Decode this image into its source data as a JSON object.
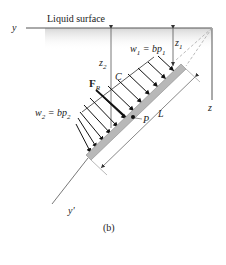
{
  "figure": {
    "caption": "(b)",
    "labels": {
      "liquid_surface": "Liquid surface",
      "y_axis": "y",
      "y_prime_axis": "y'",
      "z_axis": "z",
      "z1": "z",
      "z1_sub": "1",
      "z2": "z",
      "z2_sub": "2",
      "w1_lhs": "w",
      "w1_sub": "1",
      "w1_eq": " = bp",
      "w1_sub2": "1",
      "w2_lhs": "w",
      "w2_sub": "2",
      "w2_eq": " = bp",
      "w2_sub2": "2",
      "fr": "F",
      "fr_sub": "R",
      "centroid": "C",
      "pressure_center": "P",
      "length": "L"
    },
    "colors": {
      "line": "#555555",
      "plate": "#b8b8b8",
      "plate_edge": "#8a8a8a",
      "arrow": "#111111",
      "shade_top": "#d9d9d9",
      "dashed": "#aaaaaa"
    }
  }
}
